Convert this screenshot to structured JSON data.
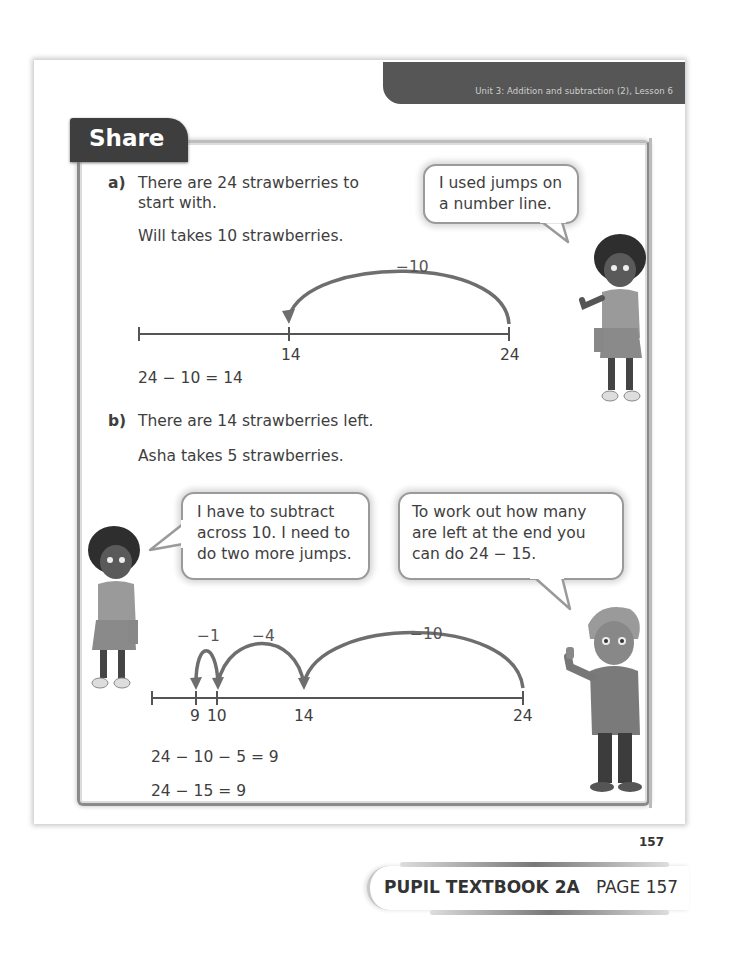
{
  "header": {
    "unit_lesson": "Unit 3: Addition and subtraction (2), Lesson 6",
    "section_title": "Share"
  },
  "part_a": {
    "label": "a)",
    "lines": [
      "There are 24 strawberries to",
      "start with.",
      "Will takes 10 strawberries."
    ],
    "bubble": [
      "I used jumps on",
      "a number line."
    ],
    "number_line": {
      "jump_label": "−10",
      "ticks": [
        "14",
        "24"
      ]
    },
    "equation": "24 − 10 = 14"
  },
  "part_b": {
    "label": "b)",
    "lines": [
      "There are 14 strawberries left.",
      "Asha takes 5 strawberries."
    ],
    "bubble_left": [
      "I have to subtract",
      "across 10. I need to",
      "do two more jumps."
    ],
    "bubble_right": [
      "To work out how many",
      "are left at the end you",
      "can do 24 − 15."
    ],
    "number_line": {
      "jump_labels": [
        "−1",
        "−4",
        "−10"
      ],
      "ticks": [
        "9",
        "10",
        "14",
        "24"
      ]
    },
    "equations": [
      "24 − 10 − 5 = 9",
      "24 − 15 = 9"
    ]
  },
  "footer": {
    "page_number": "157",
    "book_label": "PUPIL TEXTBOOK 2A",
    "page_label": "PAGE 157"
  },
  "characters": {
    "astrid_a": "girl-character",
    "astrid_b": "girl-character",
    "boy": "boy-character"
  }
}
